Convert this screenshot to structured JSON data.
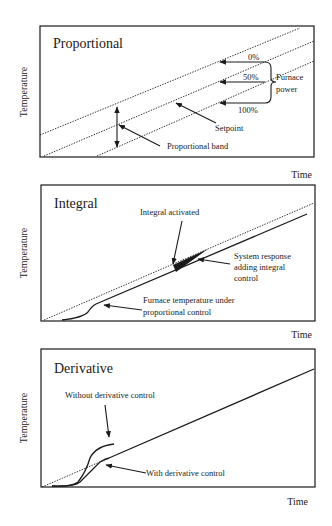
{
  "panels": [
    {
      "title": "Proportional",
      "ylabel": "Temperature",
      "xlabel": "Time",
      "labels": {
        "p0": "0%",
        "p50": "50%",
        "p100": "100%",
        "furnace1": "Furnace",
        "furnace2": "power",
        "setpoint": "Setpoint",
        "band": "Proportional band"
      }
    },
    {
      "title": "Integral",
      "ylabel": "Temperature",
      "xlabel": "Time",
      "labels": {
        "activated": "Integral activated",
        "sys1": "System response",
        "sys2": "adding integral",
        "sys3": "control",
        "furn1": "Furnace temperature under",
        "furn2": "proportional control"
      }
    },
    {
      "title": "Derivative",
      "ylabel": "Temperature",
      "xlabel": "Time",
      "labels": {
        "without": "Without derivative control",
        "with": "With derivative control"
      }
    }
  ]
}
